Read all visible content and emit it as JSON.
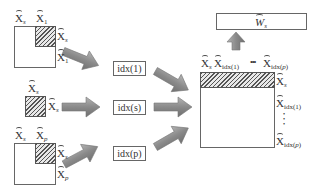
{
  "diagram": {
    "inputs": [
      {
        "id": "1",
        "col_labels": [
          "X_s",
          "X_1"
        ],
        "row_labels": [
          "X_s",
          "X_1"
        ]
      },
      {
        "id": "s",
        "col_labels": [
          "X_s"
        ],
        "row_labels": [
          "X_s"
        ]
      },
      {
        "id": "p",
        "col_labels": [
          "X_s",
          "X_p"
        ],
        "row_labels": [
          "X_s",
          "X_p"
        ]
      }
    ],
    "index_boxes": [
      "idx(1)",
      "idx(s)",
      "idx(p)"
    ],
    "output_matrix": {
      "col_labels": [
        "X_s",
        "X_idx(1)",
        "•••",
        "X_idx(p)"
      ],
      "row_labels": [
        "X_s",
        "X_idx(1)",
        "⋮",
        "X_idx(p)"
      ]
    },
    "result_box": "W_s",
    "text": {
      "X": "X",
      "W": "W",
      "s": "s",
      "one": "1",
      "p": "p",
      "idx": "idx",
      "lp": "(",
      "rp": ")",
      "dots": "•••",
      "vdots": "•\n•\n•"
    },
    "colors": {
      "arrow_fill": "#8c8c8c",
      "border": "#666666",
      "hatch": "#555555"
    }
  }
}
